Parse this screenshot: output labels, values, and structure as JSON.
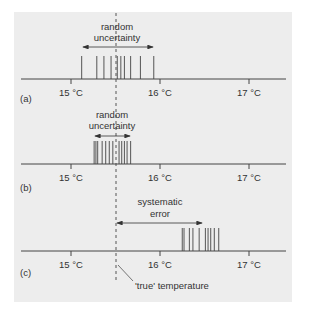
{
  "figure": {
    "true_temperature_label": "'true' temperature",
    "true_temperature_value": 15.5,
    "axis": {
      "tick_labels": [
        "15 °C",
        "16 °C",
        "17 °C"
      ],
      "tick_values": [
        15,
        16,
        17
      ],
      "unit": "°C"
    },
    "panels": [
      {
        "id": "a",
        "label": "(a)",
        "annotation_line1": "random",
        "annotation_line2": "uncertainty",
        "annotation_type": "random uncertainty",
        "readings": [
          15.12,
          15.29,
          15.37,
          15.45,
          15.52,
          15.56,
          15.6,
          15.67,
          15.78,
          15.93
        ]
      },
      {
        "id": "b",
        "label": "(b)",
        "annotation_line1": "random",
        "annotation_line2": "uncertainty",
        "annotation_type": "random uncertainty",
        "readings": [
          15.26,
          15.28,
          15.3,
          15.35,
          15.39,
          15.43,
          15.47,
          15.54,
          15.57,
          15.6,
          15.63,
          15.67
        ]
      },
      {
        "id": "c",
        "label": "(c)",
        "annotation_line1": "systematic",
        "annotation_line2": "error",
        "annotation_type": "systematic error",
        "readings": [
          16.25,
          16.27,
          16.33,
          16.37,
          16.44,
          16.51,
          16.54,
          16.57,
          16.61,
          16.66
        ]
      }
    ]
  }
}
